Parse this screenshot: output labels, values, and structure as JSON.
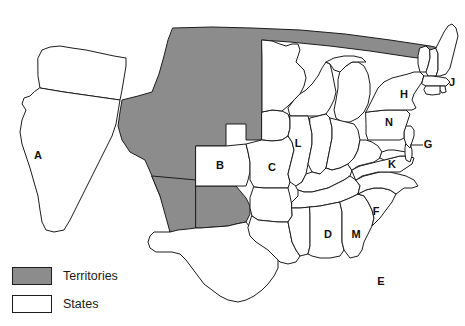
{
  "figure": {
    "type": "choropleth-map",
    "region": "United States",
    "background_color": "#ffffff",
    "outline_color": "#1c1c1c"
  },
  "legend": {
    "items": [
      {
        "label": "Territories",
        "swatch": "territory",
        "color": "#8c8c8c"
      },
      {
        "label": "States",
        "swatch": "state",
        "color": "#ffffff"
      }
    ]
  },
  "map_data": {
    "categories": [
      "Territories",
      "States"
    ],
    "colors": {
      "Territories": "#8c8c8c",
      "States": "#ffffff"
    },
    "labels": [
      {
        "id": "A",
        "category": "States",
        "x": 38,
        "y": 156
      },
      {
        "id": "B",
        "category": "States",
        "x": 220,
        "y": 166
      },
      {
        "id": "C",
        "category": "States",
        "x": 272,
        "y": 168
      },
      {
        "id": "D",
        "category": "States",
        "x": 328,
        "y": 235
      },
      {
        "id": "E",
        "category": "States",
        "x": 381,
        "y": 282
      },
      {
        "id": "F",
        "category": "States",
        "x": 376,
        "y": 212
      },
      {
        "id": "G",
        "category": "States",
        "x": 428,
        "y": 145
      },
      {
        "id": "H",
        "category": "States",
        "x": 404,
        "y": 95
      },
      {
        "id": "J",
        "category": "States",
        "x": 452,
        "y": 83
      },
      {
        "id": "K",
        "category": "States",
        "x": 392,
        "y": 165
      },
      {
        "id": "L",
        "category": "States",
        "x": 298,
        "y": 144
      },
      {
        "id": "M",
        "category": "States",
        "x": 356,
        "y": 235
      },
      {
        "id": "N",
        "category": "States",
        "x": 389,
        "y": 123
      }
    ],
    "territory_regions": [
      "northern-plains-and-mountain-west",
      "new-mexico",
      "oklahoma"
    ],
    "state_regions": [
      "oregon",
      "california",
      "texas",
      "kansas",
      "missouri",
      "iowa",
      "minnesota",
      "wisconsin",
      "michigan",
      "illinois",
      "indiana",
      "ohio",
      "kentucky",
      "tennessee",
      "arkansas",
      "louisiana",
      "mississippi",
      "alabama",
      "georgia",
      "florida",
      "south-carolina",
      "north-carolina",
      "virginia",
      "west-virginia",
      "maryland",
      "delaware",
      "new-jersey",
      "pennsylvania",
      "new-york",
      "connecticut",
      "rhode-island",
      "massachusetts",
      "vermont",
      "new-hampshire",
      "maine"
    ]
  }
}
